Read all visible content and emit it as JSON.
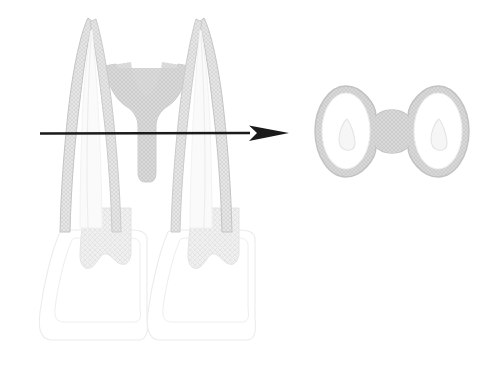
{
  "figure": {
    "title": "Tooth root longitudinal view with transverse cross-section",
    "background_color": "#ffffff",
    "width": 488,
    "height": 372
  },
  "palette": {
    "background": "#ffffff",
    "outline_dark": "#b9b9b9",
    "outline_light": "#e2e2e2",
    "outline_faint": "#efefef",
    "hatch_fill": "#d6d6d6",
    "hatch_line": "#cfcfcf",
    "canal_fill": "#f4f4f4",
    "dentin_fill": "#fbfbfb",
    "arrow_color": "#1a1a1a"
  },
  "longitudinal_view": {
    "name": "longitudinal-tooth-view",
    "description": "Two tapering roots rising to pointed apices, joined by a hatched isthmus region, widening into two crown outlines below",
    "bounds": {
      "x": 36,
      "y": 16,
      "width": 224,
      "height": 344
    },
    "roots": [
      {
        "name": "left-root",
        "apex_x": 88,
        "apex_y": 18,
        "base_y": 230,
        "has_inner_canal": true
      },
      {
        "name": "right-root",
        "apex_x": 190,
        "apex_y": 18,
        "base_y": 230,
        "has_inner_canal": true
      }
    ],
    "isthmus": {
      "name": "isthmus-region",
      "description": "Hatched web of dentin joining the two roots at the level of the section",
      "bounds": {
        "x": 103,
        "y": 62,
        "width": 76,
        "height": 120
      }
    },
    "crowns": [
      {
        "name": "left-crown",
        "bounds": {
          "x": 38,
          "y": 228,
          "width": 110,
          "height": 114
        }
      },
      {
        "name": "right-crown",
        "bounds": {
          "x": 146,
          "y": 228,
          "width": 110,
          "height": 114
        }
      }
    ]
  },
  "section_arrow": {
    "name": "section-level-arrow",
    "description": "Horizontal arrow marking the transverse section level, pointing right to the cross-section",
    "color": "#1a1a1a",
    "start_x": 40,
    "end_x": 289,
    "y": 133,
    "line_thickness": 2.6,
    "head_length": 40,
    "head_width": 17
  },
  "cross_section_view": {
    "name": "transverse-cross-section",
    "description": "Cross-section at the arrow level showing two oval canal spaces joined by an hourglass isthmus",
    "bounds": {
      "x": 313,
      "y": 84,
      "width": 158,
      "height": 96
    },
    "ovals": [
      {
        "name": "left-canal-oval",
        "center_x": 346,
        "center_y": 131,
        "radius_x": 30,
        "radius_y": 45,
        "inner_canal": {
          "name": "left-inner-canal",
          "center_x": 347,
          "center_y": 134,
          "radius_x": 8,
          "radius_y": 14
        }
      },
      {
        "name": "right-canal-oval",
        "center_x": 437,
        "center_y": 131,
        "radius_x": 30,
        "radius_y": 45,
        "inner_canal": {
          "name": "right-inner-canal",
          "center_x": 438,
          "center_y": 134,
          "radius_x": 8,
          "radius_y": 14
        }
      }
    ],
    "isthmus": {
      "name": "cross-section-isthmus",
      "description": "Narrow hourglass-shaped hatched bridge between the two oval canals",
      "center_x": 392,
      "center_y": 131,
      "narrow_width": 26,
      "height": 62
    }
  },
  "labels": {
    "longitudinal_label": "",
    "cross_section_label": "",
    "arrow_label": ""
  }
}
